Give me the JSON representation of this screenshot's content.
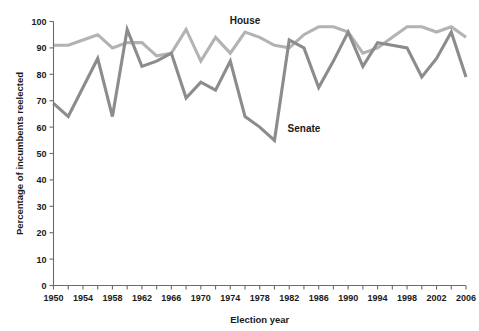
{
  "chart_data": {
    "type": "line",
    "title": "",
    "xlabel": "Election year",
    "ylabel": "Percentage of incumbents reelected",
    "xlim": [
      1950,
      2006
    ],
    "ylim": [
      0,
      100
    ],
    "grid": false,
    "legend_position": "inline-annotations",
    "x_tick_labels": [
      "1950",
      "1954",
      "1958",
      "1962",
      "1966",
      "1970",
      "1974",
      "1978",
      "1982",
      "1986",
      "1990",
      "1994",
      "1998",
      "2002",
      "2006"
    ],
    "x_tick_values": [
      1950,
      1954,
      1958,
      1962,
      1966,
      1970,
      1974,
      1978,
      1982,
      1986,
      1990,
      1994,
      1998,
      2002,
      2006
    ],
    "x_minor_tick_values": [
      1952,
      1956,
      1960,
      1964,
      1968,
      1972,
      1976,
      1980,
      1984,
      1988,
      1992,
      1996,
      2000,
      2004
    ],
    "y_tick_labels": [
      "0",
      "10",
      "20",
      "30",
      "40",
      "50",
      "60",
      "70",
      "80",
      "90",
      "100"
    ],
    "y_tick_values": [
      0,
      10,
      20,
      30,
      40,
      50,
      60,
      70,
      80,
      90,
      100
    ],
    "x": [
      1950,
      1952,
      1954,
      1956,
      1958,
      1960,
      1962,
      1964,
      1966,
      1968,
      1970,
      1972,
      1974,
      1976,
      1978,
      1980,
      1982,
      1984,
      1986,
      1988,
      1990,
      1992,
      1994,
      1996,
      1998,
      2000,
      2002,
      2004,
      2006
    ],
    "series": [
      {
        "name": "House",
        "color": "#b3b3b3",
        "label_text": "House",
        "values": [
          91,
          91,
          93,
          95,
          90,
          92,
          92,
          87,
          88,
          97,
          85,
          94,
          88,
          96,
          94,
          91,
          90,
          95,
          98,
          98,
          96,
          88,
          90,
          94,
          98,
          98,
          96,
          98,
          94
        ]
      },
      {
        "name": "Senate",
        "color": "#8c8c8c",
        "label_text": "Senate",
        "values": [
          69,
          64,
          75,
          86,
          64,
          97,
          83,
          85,
          88,
          71,
          77,
          74,
          85,
          64,
          60,
          55,
          93,
          90,
          75,
          85,
          96,
          83,
          92,
          91,
          90,
          79,
          86,
          96,
          79
        ]
      }
    ],
    "annotations": [
      {
        "text": "House",
        "x_value": 1976,
        "y_value": 99
      },
      {
        "text": "Senate",
        "x_value": 1984,
        "y_value": 58
      }
    ],
    "axis_color": "#6b6b6b",
    "text_color": "#1a1a1a"
  }
}
